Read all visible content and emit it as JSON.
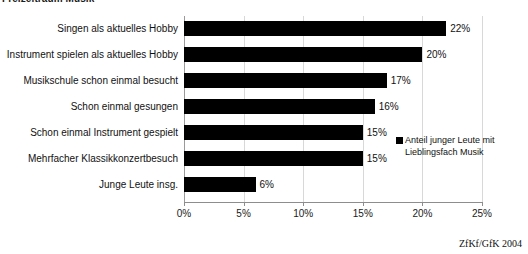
{
  "title": "Freizeitraum Musik",
  "source_note": "ZfKf/GfK 2004",
  "legend": {
    "line1": "Anteil junger Leute mit",
    "line2": "Lieblingsfach Musik",
    "swatch_color": "#000000"
  },
  "axis": {
    "ticks": [
      "0%",
      "5%",
      "10%",
      "15%",
      "20%",
      "25%"
    ]
  },
  "chart_data": {
    "type": "bar",
    "orientation": "horizontal",
    "title": "Freizeitraum Musik",
    "xlabel": "",
    "ylabel": "",
    "xlim": [
      0,
      25
    ],
    "xtick_values": [
      0,
      5,
      10,
      15,
      20,
      25
    ],
    "xtick_labels": [
      "0%",
      "5%",
      "10%",
      "15%",
      "20%",
      "25%"
    ],
    "grid": true,
    "legend_position": "right",
    "bar_color": "#000000",
    "unit": "%",
    "categories": [
      "Singen als aktuelles Hobby",
      "Instrument spielen als aktuelles Hobby",
      "Musikschule schon einmal besucht",
      "Schon einmal gesungen",
      "Schon einmal Instrument gespielt",
      "Mehrfacher Klassikkonzertbesuch",
      "Junge Leute insg."
    ],
    "values": [
      22,
      20,
      17,
      16,
      15,
      15,
      6
    ],
    "value_labels": [
      "22%",
      "20%",
      "17%",
      "16%",
      "15%",
      "15%",
      "6%"
    ],
    "series": [
      {
        "name": "Anteil junger Leute mit Lieblingsfach Musik",
        "values": [
          22,
          20,
          17,
          16,
          15,
          15,
          6
        ]
      }
    ]
  }
}
